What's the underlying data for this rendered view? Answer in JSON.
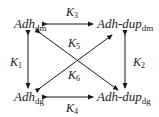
{
  "nodes": {
    "top_left": {
      "base": "Adh",
      "sub": "dm"
    },
    "top_right": {
      "base": "Adh-dup",
      "sub": "dm"
    },
    "bottom_left": {
      "base": "Adh",
      "sub": "dg"
    },
    "bottom_right": {
      "base": "Adh-dup",
      "sub": "dg"
    }
  },
  "edges": {
    "k1": {
      "base": "K",
      "sub": "1",
      "from": "Adh_dm",
      "to": "Adh_dg",
      "direction": "bidirectional"
    },
    "k2": {
      "base": "K",
      "sub": "2",
      "from": "Adh-dup_dm",
      "to": "Adh-dup_dg",
      "direction": "bidirectional"
    },
    "k3": {
      "base": "K",
      "sub": "3",
      "from": "Adh_dm",
      "to": "Adh-dup_dm",
      "direction": "bidirectional"
    },
    "k4": {
      "base": "K",
      "sub": "4",
      "from": "Adh_dg",
      "to": "Adh-dup_dg",
      "direction": "bidirectional"
    },
    "k5": {
      "base": "K",
      "sub": "5",
      "from": "Adh_dm",
      "to": "Adh-dup_dg",
      "direction": "bidirectional"
    },
    "k6": {
      "base": "K",
      "sub": "6",
      "from": "Adh_dg",
      "to": "Adh-dup_dm",
      "direction": "bidirectional"
    }
  },
  "colors": {
    "ink": "#1a1a1a",
    "background": "#ffffff"
  }
}
